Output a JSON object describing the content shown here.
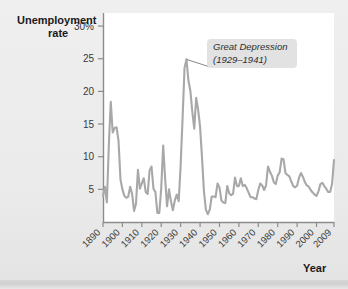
{
  "figure": {
    "background_color": "#ececec",
    "plot_background_color": "#ffffff",
    "line_color": "#a8a8a8",
    "axis_color": "#8c8c8c",
    "text_color": "#1a1a1a"
  },
  "labels": {
    "y_axis_title_line1": "Unemployment",
    "y_axis_title_line2": "rate",
    "x_axis_title": "Year"
  },
  "annotation": {
    "line1": "Great Depression",
    "line2": "(1929–1941)",
    "box_color": "#e2e2e2",
    "target_year": 1933,
    "target_value": 24.9
  },
  "chart_data": {
    "type": "line",
    "title": "",
    "xlabel": "Year",
    "ylabel": "Unemployment rate",
    "grid": false,
    "legend": "none",
    "xlim": [
      1890,
      2009
    ],
    "ylim": [
      0,
      32
    ],
    "ytick_labels": [
      "30%",
      "25",
      "20",
      "15",
      "10",
      "5"
    ],
    "ytick_values": [
      30,
      25,
      20,
      15,
      10,
      5
    ],
    "xtick_labels": [
      "1890",
      "1900",
      "1910",
      "1920",
      "1930",
      "1940",
      "1950",
      "1960",
      "1970",
      "1980",
      "1990",
      "2000",
      "2009"
    ],
    "xtick_values": [
      1890,
      1900,
      1910,
      1920,
      1930,
      1940,
      1950,
      1960,
      1970,
      1980,
      1990,
      2000,
      2009
    ],
    "series": [
      {
        "name": "Unemployment rate",
        "x": [
          1890,
          1891,
          1892,
          1893,
          1894,
          1895,
          1896,
          1897,
          1898,
          1899,
          1900,
          1901,
          1902,
          1903,
          1904,
          1905,
          1906,
          1907,
          1908,
          1909,
          1910,
          1911,
          1912,
          1913,
          1914,
          1915,
          1916,
          1917,
          1918,
          1919,
          1920,
          1921,
          1922,
          1923,
          1924,
          1925,
          1926,
          1927,
          1928,
          1929,
          1930,
          1931,
          1932,
          1933,
          1934,
          1935,
          1936,
          1937,
          1938,
          1939,
          1940,
          1941,
          1942,
          1943,
          1944,
          1945,
          1946,
          1947,
          1948,
          1949,
          1950,
          1951,
          1952,
          1953,
          1954,
          1955,
          1956,
          1957,
          1958,
          1959,
          1960,
          1961,
          1962,
          1963,
          1964,
          1965,
          1966,
          1967,
          1968,
          1969,
          1970,
          1971,
          1972,
          1973,
          1974,
          1975,
          1976,
          1977,
          1978,
          1979,
          1980,
          1981,
          1982,
          1983,
          1984,
          1985,
          1986,
          1987,
          1988,
          1989,
          1990,
          1991,
          1992,
          1993,
          1994,
          1995,
          1996,
          1997,
          1998,
          1999,
          2000,
          2001,
          2002,
          2003,
          2004,
          2005,
          2006,
          2007,
          2008,
          2009
        ],
        "values": [
          4.0,
          5.4,
          3.0,
          11.7,
          18.4,
          13.7,
          14.4,
          14.5,
          12.4,
          6.5,
          5.0,
          4.0,
          3.7,
          3.9,
          5.4,
          4.3,
          1.7,
          2.8,
          8.0,
          5.1,
          5.9,
          6.7,
          4.6,
          4.3,
          7.9,
          8.5,
          5.1,
          4.6,
          1.4,
          1.4,
          5.2,
          11.7,
          6.7,
          2.4,
          5.0,
          3.2,
          1.8,
          3.3,
          4.2,
          3.2,
          8.7,
          15.9,
          23.6,
          24.9,
          21.7,
          20.1,
          16.9,
          14.3,
          19.0,
          17.2,
          14.6,
          9.9,
          4.7,
          1.9,
          1.2,
          1.9,
          3.9,
          3.9,
          3.8,
          5.9,
          5.3,
          3.3,
          3.0,
          2.9,
          5.5,
          4.4,
          4.1,
          4.3,
          6.8,
          5.5,
          5.5,
          6.7,
          5.5,
          5.7,
          5.2,
          4.5,
          3.8,
          3.8,
          3.6,
          3.5,
          4.9,
          5.9,
          5.6,
          4.9,
          5.6,
          8.5,
          7.7,
          7.1,
          6.1,
          5.8,
          7.1,
          7.6,
          9.7,
          9.6,
          7.5,
          7.2,
          7.0,
          6.2,
          5.5,
          5.3,
          5.6,
          6.8,
          7.5,
          6.9,
          6.1,
          5.6,
          5.4,
          4.9,
          4.5,
          4.2,
          4.0,
          4.7,
          5.8,
          6.0,
          5.5,
          5.1,
          4.6,
          4.6,
          5.8,
          9.5
        ]
      }
    ]
  }
}
